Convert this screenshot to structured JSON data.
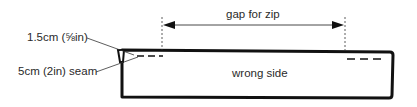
{
  "diagram": {
    "type": "sewing-instruction",
    "labels": {
      "gap": "gap for zip",
      "panel": "wrong side",
      "seam_allowance": "1.5cm (⅝in)",
      "seam": "5cm (2in) seam"
    },
    "colors": {
      "outline": "#111111",
      "text": "#2a2a2a",
      "background": "#ffffff"
    }
  }
}
